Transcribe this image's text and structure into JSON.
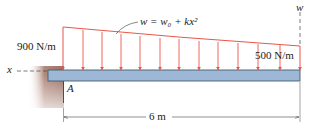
{
  "diagram": {
    "load_left_label": "900 N/m",
    "load_right_label": "500 N/m",
    "load_equation": "w = w₀ + kx²",
    "w_axis_label": "w",
    "x_axis_label": "x",
    "point_label": "A",
    "span_label": "6 m",
    "colors": {
      "load": "#e8574a",
      "beam": "#9cb8d6",
      "beam_edge": "#4a5a6e",
      "wall": "#a07a6c"
    },
    "arrow_count": 11
  }
}
